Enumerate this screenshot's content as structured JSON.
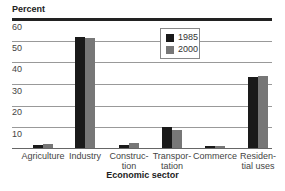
{
  "chart_data": {
    "type": "bar",
    "title": "",
    "ylabel": "Percent",
    "xlabel": "Economic sector",
    "ylim": [
      0,
      60
    ],
    "yticks": [
      10,
      20,
      30,
      40,
      50,
      60
    ],
    "grid": true,
    "legend_position": "upper center",
    "categories": [
      "Agriculture",
      "Industry",
      "Construction",
      "Transportation",
      "Commerce",
      "Residential uses"
    ],
    "category_labels_display": [
      [
        "Agriculture"
      ],
      [
        "Industry"
      ],
      [
        "Construc-",
        "tion"
      ],
      [
        "Transpor-",
        "tation"
      ],
      [
        "Commerce"
      ],
      [
        "Residen-",
        "tial uses"
      ]
    ],
    "series": [
      {
        "name": "1985",
        "color": "#1a1a1a",
        "values": [
          1.5,
          51.5,
          1.5,
          10,
          1,
          33
        ]
      },
      {
        "name": "2000",
        "color": "#777777",
        "values": [
          2,
          51,
          2.5,
          8.5,
          1,
          33.5
        ]
      }
    ]
  },
  "labels": {
    "y_title": "Percent",
    "x_title": "Economic sector",
    "ticks": [
      "10",
      "20",
      "30",
      "40",
      "50",
      "60"
    ],
    "legend": [
      "1985",
      "2000"
    ],
    "cats": [
      [
        "Agriculture",
        ""
      ],
      [
        "Industry",
        ""
      ],
      [
        "Construc-",
        "tion"
      ],
      [
        "Transpor-",
        "tation"
      ],
      [
        "Commerce",
        ""
      ],
      [
        "Residen-",
        "tial uses"
      ]
    ]
  }
}
